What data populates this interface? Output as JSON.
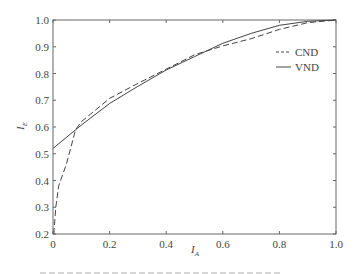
{
  "chart_data": {
    "type": "line",
    "title": "",
    "xlabel": "I_A",
    "ylabel": "I_E",
    "xlim": [
      0,
      1.0
    ],
    "ylim": [
      0.2,
      1.0
    ],
    "grid": false,
    "legend_position": "upper right (inside)",
    "x_ticks": [
      "0",
      "0.2",
      "0.4",
      "0.6",
      "0.8",
      "1.0"
    ],
    "y_ticks": [
      "0.2",
      "0.3",
      "0.4",
      "0.5",
      "0.6",
      "0.7",
      "0.8",
      "0.9",
      "1.0"
    ],
    "series": [
      {
        "name": "CND",
        "style": "dashed",
        "x": [
          0.003,
          0.01,
          0.02,
          0.047,
          0.08,
          0.1,
          0.2,
          0.3,
          0.4,
          0.5,
          0.6,
          0.7,
          0.8,
          0.9,
          1.0
        ],
        "y": [
          0.2,
          0.3,
          0.38,
          0.46,
          0.59,
          0.62,
          0.707,
          0.763,
          0.816,
          0.87,
          0.903,
          0.93,
          0.965,
          0.99,
          1.0
        ]
      },
      {
        "name": "VND",
        "style": "solid",
        "x": [
          0.0,
          0.1,
          0.2,
          0.3,
          0.4,
          0.5,
          0.6,
          0.7,
          0.8,
          0.9,
          1.0
        ],
        "y": [
          0.52,
          0.607,
          0.688,
          0.752,
          0.813,
          0.863,
          0.913,
          0.95,
          0.98,
          0.995,
          1.0
        ]
      }
    ]
  },
  "labels": {
    "xlabel_main": "I",
    "xlabel_sub": "A",
    "ylabel_main": "I",
    "ylabel_sub": "E",
    "legend": [
      "CND",
      "VND"
    ]
  }
}
